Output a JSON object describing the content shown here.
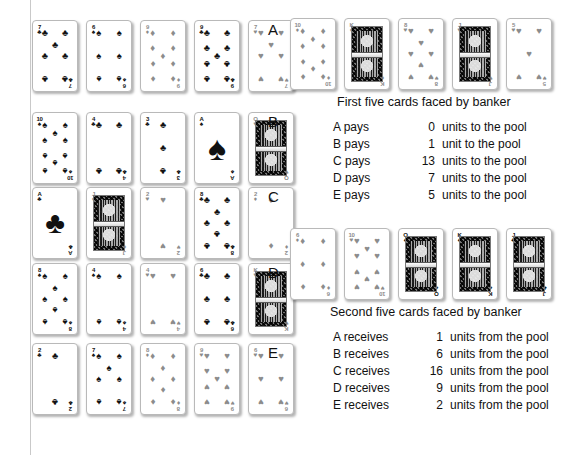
{
  "figure": {
    "row_labels": [
      "A",
      "B",
      "C",
      "D",
      "E"
    ],
    "captions": {
      "first": "First five cards faced by banker",
      "second": "Second five cards faced by banker"
    }
  },
  "player_hands": [
    {
      "label": "A",
      "cards": [
        {
          "rank": "7",
          "suit": "clubs",
          "suit_char": "♣",
          "tone": "black"
        },
        {
          "rank": "6",
          "suit": "spades",
          "suit_char": "♠",
          "tone": "black"
        },
        {
          "rank": "9",
          "suit": "diamonds",
          "suit_char": "♦",
          "tone": "grey"
        },
        {
          "rank": "9",
          "suit": "clubs",
          "suit_char": "♣",
          "tone": "black"
        },
        {
          "rank": "7",
          "suit": "hearts",
          "suit_char": "♥",
          "tone": "grey"
        }
      ]
    },
    {
      "label": "B",
      "cards": [
        {
          "rank": "10",
          "suit": "spades",
          "suit_char": "♠",
          "tone": "black"
        },
        {
          "rank": "4",
          "suit": "clubs",
          "suit_char": "♣",
          "tone": "black"
        },
        {
          "rank": "3",
          "suit": "clubs",
          "suit_char": "♣",
          "tone": "black"
        },
        {
          "rank": "A",
          "suit": "spades",
          "suit_char": "♠",
          "tone": "black"
        },
        {
          "rank": "Q",
          "suit": "hearts",
          "suit_char": "♥",
          "tone": "grey"
        }
      ]
    },
    {
      "label": "C",
      "cards": [
        {
          "rank": "A",
          "suit": "clubs",
          "suit_char": "♣",
          "tone": "black"
        },
        {
          "rank": "J",
          "suit": "diamonds",
          "suit_char": "♦",
          "tone": "grey"
        },
        {
          "rank": "2",
          "suit": "hearts",
          "suit_char": "♥",
          "tone": "grey"
        },
        {
          "rank": "8",
          "suit": "clubs",
          "suit_char": "♣",
          "tone": "black"
        },
        {
          "rank": "2",
          "suit": "diamonds",
          "suit_char": "♦",
          "tone": "grey"
        }
      ]
    },
    {
      "label": "D",
      "cards": [
        {
          "rank": "8",
          "suit": "spades",
          "suit_char": "♠",
          "tone": "black"
        },
        {
          "rank": "4",
          "suit": "spades",
          "suit_char": "♠",
          "tone": "black"
        },
        {
          "rank": "4",
          "suit": "hearts",
          "suit_char": "♥",
          "tone": "grey"
        },
        {
          "rank": "6",
          "suit": "clubs",
          "suit_char": "♣",
          "tone": "black"
        },
        {
          "rank": "K",
          "suit": "hearts",
          "suit_char": "♥",
          "tone": "grey"
        }
      ]
    },
    {
      "label": "E",
      "cards": [
        {
          "rank": "2",
          "suit": "clubs",
          "suit_char": "♣",
          "tone": "black"
        },
        {
          "rank": "7",
          "suit": "spades",
          "suit_char": "♠",
          "tone": "black"
        },
        {
          "rank": "8",
          "suit": "diamonds",
          "suit_char": "♦",
          "tone": "grey"
        },
        {
          "rank": "9",
          "suit": "hearts",
          "suit_char": "♥",
          "tone": "grey"
        },
        {
          "rank": "6",
          "suit": "hearts",
          "suit_char": "♥",
          "tone": "grey"
        }
      ]
    }
  ],
  "banker_first": [
    {
      "rank": "10",
      "suit": "diamonds",
      "suit_char": "♦",
      "tone": "grey"
    },
    {
      "rank": "K",
      "suit": "diamonds",
      "suit_char": "♦",
      "tone": "grey"
    },
    {
      "rank": "8",
      "suit": "hearts",
      "suit_char": "♥",
      "tone": "grey"
    },
    {
      "rank": "J",
      "suit": "hearts",
      "suit_char": "♥",
      "tone": "grey"
    },
    {
      "rank": "5",
      "suit": "hearts",
      "suit_char": "♥",
      "tone": "grey"
    }
  ],
  "banker_second": [
    {
      "rank": "6",
      "suit": "diamonds",
      "suit_char": "♦",
      "tone": "grey"
    },
    {
      "rank": "10",
      "suit": "hearts",
      "suit_char": "♥",
      "tone": "grey"
    },
    {
      "rank": "Q",
      "suit": "spades",
      "suit_char": "♠",
      "tone": "black"
    },
    {
      "rank": "K",
      "suit": "spades",
      "suit_char": "♠",
      "tone": "black"
    },
    {
      "rank": "J",
      "suit": "clubs",
      "suit_char": "♣",
      "tone": "black"
    }
  ],
  "pays_table": [
    {
      "who": "A pays",
      "amount": "0",
      "text": "units to the pool"
    },
    {
      "who": "B pays",
      "amount": "1",
      "text": "unit to the pool"
    },
    {
      "who": "C pays",
      "amount": "13",
      "text": "units to the pool"
    },
    {
      "who": "D pays",
      "amount": "7",
      "text": "units to the pool"
    },
    {
      "who": "E pays",
      "amount": "5",
      "text": "units to the pool"
    }
  ],
  "receives_table": [
    {
      "who": "A receives",
      "amount": "1",
      "text": "units from the pool"
    },
    {
      "who": "B receives",
      "amount": "6",
      "text": "units from the pool"
    },
    {
      "who": "C receives",
      "amount": "16",
      "text": "units from the pool"
    },
    {
      "who": "D receives",
      "amount": "9",
      "text": "units from the pool"
    },
    {
      "who": "E receives",
      "amount": "2",
      "text": "units from the pool"
    }
  ]
}
